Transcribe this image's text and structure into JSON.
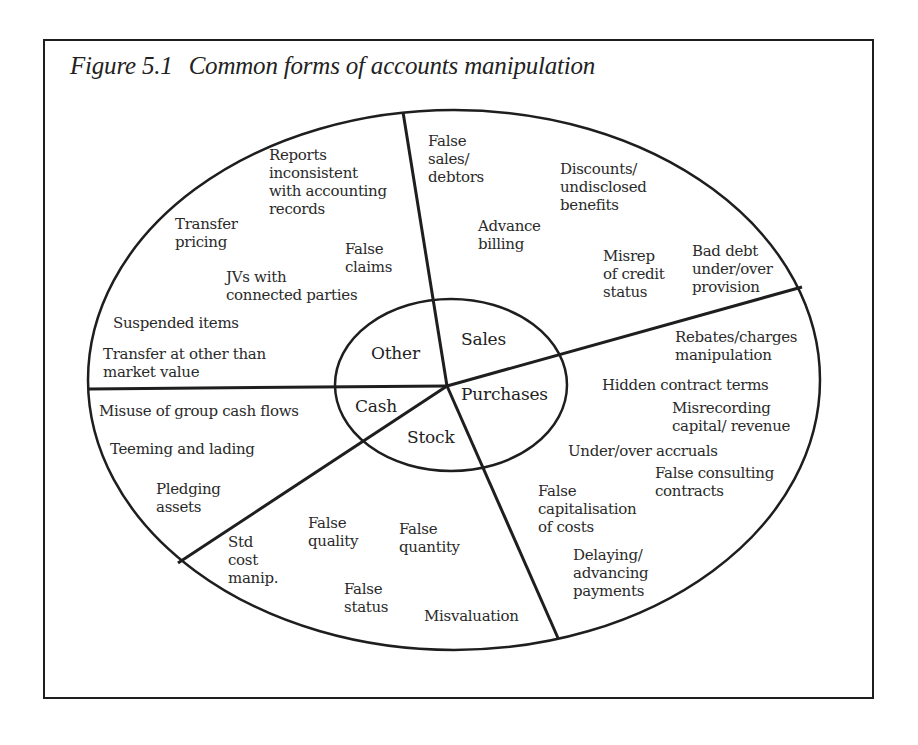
{
  "figure": {
    "number": "Figure 5.1",
    "title": "Common forms of accounts manipulation"
  },
  "categories": {
    "other": "Other",
    "sales": "Sales",
    "purchases": "Purchases",
    "stock": "Stock",
    "cash": "Cash"
  },
  "segments": {
    "other": [
      "Reports\ninconsistent\nwith accounting\nrecords",
      "Transfer\npricing",
      "False\nclaims",
      "JVs with\nconnected parties",
      "Suspended items",
      "Transfer at other than\nmarket value"
    ],
    "sales": [
      "False\nsales/\ndebtors",
      "Discounts/\nundisclosed\nbenefits",
      "Advance\nbilling",
      "Misrep\nof credit\nstatus",
      "Bad debt\nunder/over\nprovision"
    ],
    "purchases": [
      "Rebates/charges\nmanipulation",
      "Hidden contract terms",
      "Misrecording\ncapital/ revenue",
      "Under/over accruals",
      "False consulting\ncontracts",
      "False\ncapitalisation\nof costs",
      "Delaying/\nadvancing\npayments"
    ],
    "stock": [
      "Std\ncost\nmanip.",
      "False\nquality",
      "False\nquantity",
      "False\nstatus",
      "Misvaluation"
    ],
    "cash": [
      "Misuse of group cash flows",
      "Teeming and lading",
      "Pledging\nassets"
    ]
  },
  "colors": {
    "line": "#1e1e1e",
    "text": "#2a2a2a",
    "background": "#ffffff"
  }
}
